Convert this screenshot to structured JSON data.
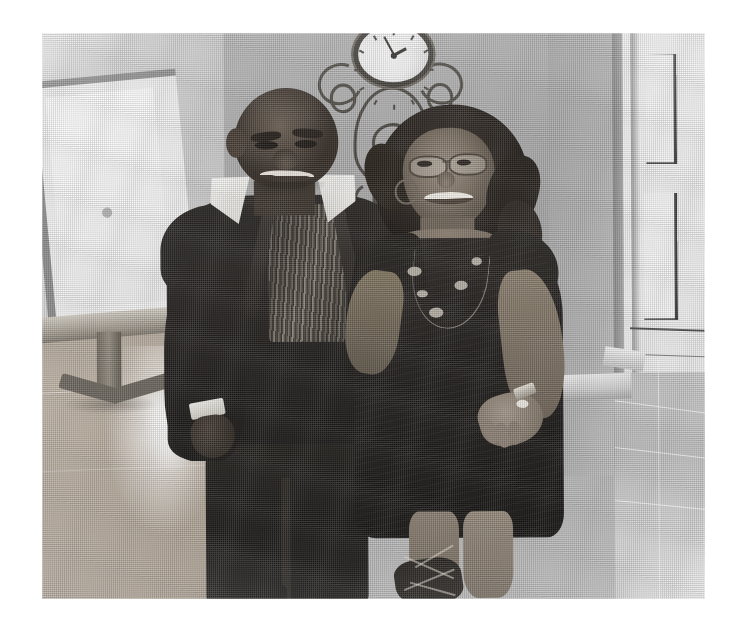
{
  "page": {
    "background_color": "#ffffff",
    "width": 741,
    "height": 640
  },
  "photo": {
    "caption": "Scanned black-and-white photograph of a couple standing together indoors",
    "alt_text": "A man in a dark suit jacket with a white collared shirt and striped vest stands beside a woman in a sleeveless dark dress with glasses and curly hair; a decorative wrought-iron wall clock hangs on the wall behind them.",
    "media_type": "photocopied photograph",
    "color_mode": "grayscale",
    "border_color": "#ffffff",
    "frame": {
      "left": 42,
      "top": 33,
      "width": 663,
      "height": 566
    },
    "tones": {
      "paper_white": "#ffffff",
      "wall_light": "#d2d2d2",
      "wall_mid": "#adadad",
      "floor_wood": "#b4a89a",
      "shadow_dark": "#1d1a18",
      "black_point": "#131110"
    }
  },
  "subjects": [
    {
      "id": "man",
      "label": "Man on the left",
      "pose": "standing, left arm down, right arm behind the woman",
      "clothing": [
        "dark suit jacket",
        "white collared shirt",
        "vertically striped vest",
        "dark trousers",
        "dark shoes"
      ],
      "details": [
        "short hair",
        "smiling",
        "white shirt cuff at left wrist"
      ]
    },
    {
      "id": "woman",
      "label": "Woman on the right",
      "pose": "standing, right hand resting on hip",
      "clothing": [
        "sleeveless dark dress",
        "strappy sandals"
      ],
      "details": [
        "eyeglasses",
        "curly shoulder-length hair",
        "hoop earrings",
        "beaded necklace",
        "ring",
        "wristwatch",
        "smiling"
      ]
    }
  ],
  "background": {
    "items": [
      {
        "id": "wall-clock",
        "label": "Decorative wrought-iron wall clock",
        "position": "centre, above the couple"
      },
      {
        "id": "mirror",
        "label": "Framed mirror or picture",
        "position": "left wall"
      },
      {
        "id": "pedestal-table",
        "label": "Pedestal side table",
        "position": "left, in front of the mirror"
      },
      {
        "id": "white-door",
        "label": "White panelled door",
        "position": "far right"
      },
      {
        "id": "hardwood-floor",
        "label": "Reflective hardwood floor",
        "position": "lower left"
      },
      {
        "id": "tiled-floor",
        "label": "Tiled floor",
        "position": "lower right, past the doorway"
      },
      {
        "id": "baseboard",
        "label": "White baseboard trim",
        "position": "behind the couple, right"
      }
    ]
  }
}
